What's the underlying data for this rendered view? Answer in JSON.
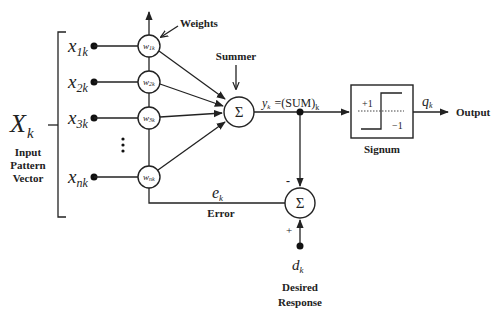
{
  "diagram": {
    "input_vector": {
      "symbol": "X",
      "subscript": "k",
      "caption_lines": [
        "Input",
        "Pattern",
        "Vector"
      ]
    },
    "inputs": [
      {
        "base": "x",
        "sub": "1k"
      },
      {
        "base": "x",
        "sub": "2k"
      },
      {
        "base": "x",
        "sub": "3k"
      },
      {
        "base": "x",
        "sub": "nk"
      }
    ],
    "ellipsis": "⋮",
    "weights": [
      {
        "base": "w",
        "sub": "1k"
      },
      {
        "base": "w",
        "sub": "2k"
      },
      {
        "base": "w",
        "sub": "3k"
      },
      {
        "base": "w",
        "sub": "nk"
      }
    ],
    "weights_label": "Weights",
    "summer": {
      "label": "Summer",
      "symbol": "Σ"
    },
    "sum_output": {
      "base": "y",
      "sub": "k",
      "eq": "=(SUM)",
      "eq_sub": "k"
    },
    "signum": {
      "label": "Signum",
      "plus": "+1",
      "minus": "−1"
    },
    "output": {
      "base": "q",
      "sub": "k",
      "label": "Output"
    },
    "error_summer": {
      "symbol": "Σ",
      "minus_sign": "-",
      "plus_sign": "+"
    },
    "error": {
      "base": "e",
      "sub": "k",
      "label": "Error"
    },
    "desired": {
      "base": "d",
      "sub": "k",
      "caption_lines": [
        "Desired",
        "Response"
      ]
    },
    "colors": {
      "ink": "#222222",
      "background": "#ffffff"
    }
  }
}
